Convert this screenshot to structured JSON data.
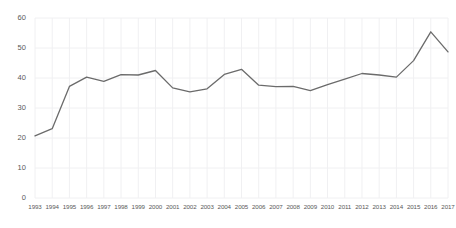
{
  "chart_data": {
    "type": "line",
    "title": "",
    "subtitle": "",
    "xlabel": "",
    "ylabel": "",
    "categories": [
      "1993",
      "1994",
      "1995",
      "1996",
      "1997",
      "1998",
      "1999",
      "2000",
      "2001",
      "2002",
      "2003",
      "2004",
      "2005",
      "2006",
      "2007",
      "2008",
      "2009",
      "2010",
      "2011",
      "2012",
      "2013",
      "2014",
      "2015",
      "2016",
      "2017"
    ],
    "values": [
      20.7,
      23.1,
      37.2,
      40.3,
      38.9,
      41.1,
      41.0,
      42.5,
      36.7,
      35.4,
      36.4,
      41.2,
      42.9,
      37.6,
      37.1,
      37.2,
      35.8,
      37.8,
      39.6,
      41.5,
      41.0,
      40.3,
      45.8,
      55.4,
      48.7
    ],
    "series": [
      {
        "name": "series-1",
        "color": "#6b6b6b",
        "values": [
          20.7,
          23.1,
          37.2,
          40.3,
          38.9,
          41.1,
          41.0,
          42.5,
          36.7,
          35.4,
          36.4,
          41.2,
          42.9,
          37.6,
          37.1,
          37.2,
          35.8,
          37.8,
          39.6,
          41.5,
          41.0,
          40.3,
          45.8,
          55.4,
          48.7
        ]
      }
    ],
    "ylim": [
      0,
      60
    ],
    "yticks": [
      0,
      10,
      20,
      30,
      40,
      50,
      60
    ],
    "ytick_labels": [
      "0",
      "10",
      "20",
      "30",
      "40",
      "50",
      "60"
    ],
    "xtick_labels": [
      "1993",
      "1994",
      "1995",
      "1996",
      "1997",
      "1998",
      "1999",
      "2000",
      "2001",
      "2002",
      "2003",
      "2004",
      "2005",
      "2006",
      "2007",
      "2008",
      "2009",
      "2010",
      "2011",
      "2012",
      "2013",
      "2014",
      "2015",
      "2016",
      "2017"
    ],
    "grid": {
      "horizontal": true,
      "vertical": true,
      "color": "#f0f0f2"
    },
    "legend": {
      "visible": false,
      "position": "none",
      "entries": []
    },
    "line_color": "#6b6b6b",
    "line_width": 1.3,
    "markers": false,
    "background_color": "#ffffff",
    "axis_label_color": "#595959"
  },
  "axis": {
    "y_labels": [
      "60",
      "50",
      "40",
      "30",
      "20",
      "10",
      "0"
    ],
    "x_labels": [
      "1993",
      "1994",
      "1995",
      "1996",
      "1997",
      "1998",
      "1999",
      "2000",
      "2001",
      "2002",
      "2003",
      "2004",
      "2005",
      "2006",
      "2007",
      "2008",
      "2009",
      "2010",
      "2011",
      "2012",
      "2013",
      "2014",
      "2015",
      "2016",
      "2017"
    ]
  }
}
